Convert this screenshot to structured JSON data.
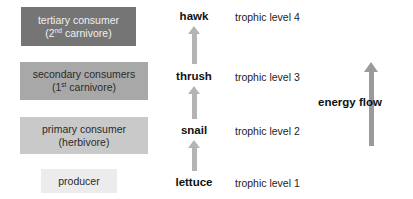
{
  "diagram": {
    "colors": {
      "tertiary_box": "#757575",
      "secondary_box": "#a8a8a8",
      "primary_box": "#c9c9c9",
      "producer_box": "#ececec",
      "chain_arrow": "#b4b4b4",
      "energy_arrow": "#9a9a9a",
      "background": "#ffffff"
    },
    "levels": [
      {
        "role_line1": "tertiary consumer",
        "role_line2_pre": "(2",
        "role_line2_sup": "nd",
        "role_line2_post": " carnivore)",
        "organism": "hawk",
        "trophic": "trophic level 4"
      },
      {
        "role_line1": "secondary consumers",
        "role_line2_pre": "(1",
        "role_line2_sup": "st",
        "role_line2_post": " carnivore)",
        "organism": "thrush",
        "trophic": "trophic level 3"
      },
      {
        "role_line1": "primary consumer",
        "role_line2_pre": "(herbivore)",
        "role_line2_sup": "",
        "role_line2_post": "",
        "organism": "snail",
        "trophic": "trophic level 2"
      },
      {
        "role_line1": "producer",
        "role_line2_pre": "",
        "role_line2_sup": "",
        "role_line2_post": "",
        "organism": "lettuce",
        "trophic": "trophic level 1"
      }
    ],
    "energy_flow_label": "energy flow"
  }
}
